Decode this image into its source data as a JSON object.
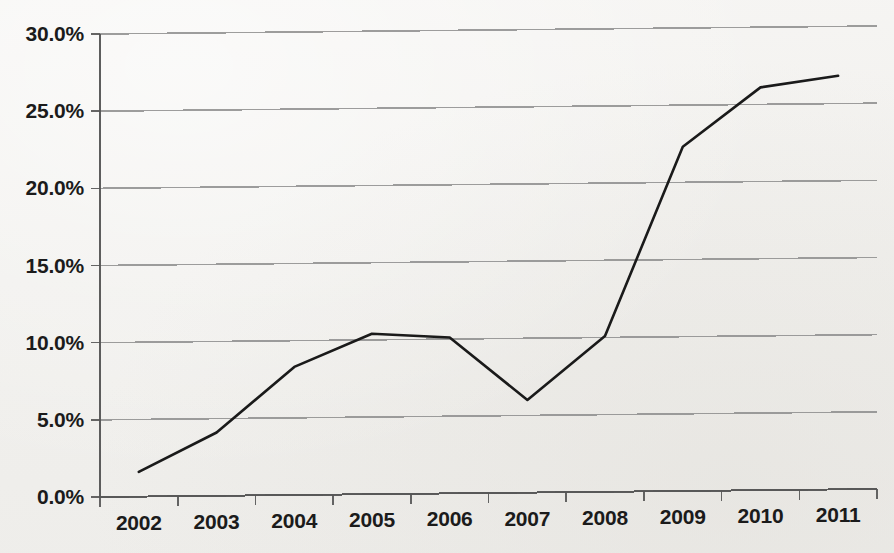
{
  "chart_data": {
    "type": "line",
    "title": "",
    "subtitle": "",
    "xlabel": "",
    "ylabel": "",
    "categories": [
      "2002",
      "2003",
      "2004",
      "2005",
      "2006",
      "2007",
      "2008",
      "2009",
      "2010",
      "2011"
    ],
    "values": [
      1.6,
      4.1,
      8.3,
      10.4,
      10.1,
      6.0,
      10.1,
      22.3,
      26.1,
      26.8
    ],
    "series": [
      {
        "name": "",
        "values": [
          1.6,
          4.1,
          8.3,
          10.4,
          10.1,
          6.0,
          10.1,
          22.3,
          26.1,
          26.8
        ]
      }
    ],
    "ylim": [
      0,
      30
    ],
    "ytick_values": [
      0,
      5,
      10,
      15,
      20,
      25,
      30
    ],
    "ytick_labels": [
      "0.0%",
      "5.0%",
      "10.0%",
      "15.0%",
      "20.0%",
      "25.0%",
      "30.0%"
    ],
    "xtick_labels": [
      "2002",
      "2003",
      "2004",
      "2005",
      "2006",
      "2007",
      "2008",
      "2009",
      "2010",
      "2011"
    ],
    "grid": true,
    "grid_axis": "y",
    "legend": false,
    "legend_position": "none",
    "annotations": [],
    "value_unit": "percent",
    "line_color": "#1a1a1a",
    "grid_color": "#8d8d8d",
    "axis_color": "#555555",
    "background_color": "#f3f2f0"
  }
}
